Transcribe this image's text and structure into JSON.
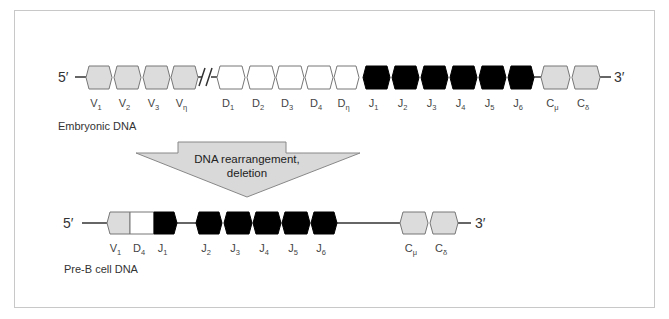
{
  "colors": {
    "v_fill": "#dcdcdc",
    "d_fill": "#ffffff",
    "j_fill": "#000000",
    "c_fill": "#dcdcdc",
    "stroke": "#777777",
    "line": "#333333",
    "arrow_fill": "#d9d9d9",
    "frame": "#c8c8c8"
  },
  "embryonic": {
    "title": "Embryonic DNA",
    "five_prime": "5′",
    "three_prime": "3′",
    "segments": [
      {
        "type": "V",
        "main": "V",
        "sub": "1",
        "x1": 86,
        "x2": 112
      },
      {
        "type": "V",
        "main": "V",
        "sub": "2",
        "x1": 114,
        "x2": 141
      },
      {
        "type": "V",
        "main": "V",
        "sub": "3",
        "x1": 143,
        "x2": 170
      },
      {
        "type": "V",
        "main": "V",
        "sub": "η",
        "x1": 171,
        "x2": 198
      },
      {
        "type": "D",
        "main": "D",
        "sub": "1",
        "x1": 217,
        "x2": 245
      },
      {
        "type": "D",
        "main": "D",
        "sub": "2",
        "x1": 247,
        "x2": 275
      },
      {
        "type": "D",
        "main": "D",
        "sub": "3",
        "x1": 276,
        "x2": 304
      },
      {
        "type": "D",
        "main": "D",
        "sub": "4",
        "x1": 305,
        "x2": 333
      },
      {
        "type": "D",
        "main": "D",
        "sub": "η",
        "x1": 334,
        "x2": 359
      },
      {
        "type": "J",
        "main": "J",
        "sub": "1",
        "x1": 363,
        "x2": 390
      },
      {
        "type": "J",
        "main": "J",
        "sub": "2",
        "x1": 392,
        "x2": 419
      },
      {
        "type": "J",
        "main": "J",
        "sub": "3",
        "x1": 421,
        "x2": 448
      },
      {
        "type": "J",
        "main": "J",
        "sub": "4",
        "x1": 450,
        "x2": 477
      },
      {
        "type": "J",
        "main": "J",
        "sub": "5",
        "x1": 479,
        "x2": 506
      },
      {
        "type": "J",
        "main": "J",
        "sub": "6",
        "x1": 508,
        "x2": 534
      },
      {
        "type": "C",
        "main": "C",
        "sub": "μ",
        "x1": 541,
        "x2": 570
      },
      {
        "type": "C",
        "main": "C",
        "sub": "δ",
        "x1": 572,
        "x2": 600
      }
    ]
  },
  "arrow": {
    "line1": "DNA rearrangement,",
    "line2": "deletion"
  },
  "preb": {
    "title": "Pre-B cell DNA",
    "five_prime": "5′",
    "three_prime": "3′",
    "segments": [
      {
        "type": "V",
        "main": "V",
        "sub": "1",
        "x1": 107,
        "x2": 130,
        "fused": "left"
      },
      {
        "type": "D",
        "main": "D",
        "sub": "4",
        "x1": 130,
        "x2": 154,
        "fused": "mid"
      },
      {
        "type": "J",
        "main": "J",
        "sub": "1",
        "x1": 154,
        "x2": 177,
        "fused": "right"
      },
      {
        "type": "J",
        "main": "J",
        "sub": "2",
        "x1": 196,
        "x2": 222
      },
      {
        "type": "J",
        "main": "J",
        "sub": "3",
        "x1": 224,
        "x2": 252
      },
      {
        "type": "J",
        "main": "J",
        "sub": "4",
        "x1": 253,
        "x2": 281
      },
      {
        "type": "J",
        "main": "J",
        "sub": "5",
        "x1": 282,
        "x2": 310
      },
      {
        "type": "J",
        "main": "J",
        "sub": "6",
        "x1": 311,
        "x2": 337
      },
      {
        "type": "C",
        "main": "C",
        "sub": "μ",
        "x1": 400,
        "x2": 428
      },
      {
        "type": "C",
        "main": "C",
        "sub": "δ",
        "x1": 430,
        "x2": 458
      }
    ]
  }
}
